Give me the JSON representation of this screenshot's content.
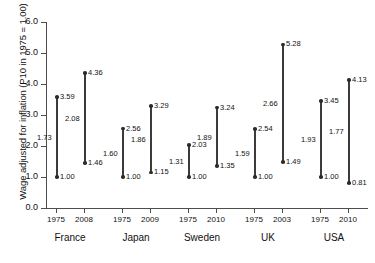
{
  "chart_data": {
    "type": "scatter",
    "title": "",
    "subtitle": "",
    "xlabel": "",
    "ylabel": "Wage adjusted for inflation (P10 in 1975 = 1.00)",
    "ylim": [
      0.0,
      6.0
    ],
    "yticks": [
      "0.0",
      "1.0",
      "2.0",
      "3.0",
      "4.0",
      "5.0",
      "6.0"
    ],
    "grid": false,
    "legend": "none",
    "note": "Each vertical segment spans from the lower wage value to the upper wage value for a given country-year; the number beside the middle of each segment is the ratio of upper to lower.",
    "groups": [
      {
        "country": "France",
        "series": [
          {
            "year": "1975",
            "low": 1.0,
            "high": 3.59,
            "ratio": 1.73,
            "low_label": "1.00",
            "high_label": "3.59",
            "ratio_label": "1.73"
          },
          {
            "year": "2008",
            "low": 1.46,
            "high": 4.36,
            "ratio": 2.08,
            "low_label": "1.46",
            "high_label": "4.36",
            "ratio_label": "2.08"
          }
        ]
      },
      {
        "country": "Japan",
        "series": [
          {
            "year": "1975",
            "low": 1.0,
            "high": 2.56,
            "ratio": 1.6,
            "low_label": "1.00",
            "high_label": "2.56",
            "ratio_label": "1.60"
          },
          {
            "year": "2009",
            "low": 1.15,
            "high": 3.29,
            "ratio": 1.86,
            "low_label": "1.15",
            "high_label": "3.29",
            "ratio_label": "1.86"
          }
        ]
      },
      {
        "country": "Sweden",
        "series": [
          {
            "year": "1975",
            "low": 1.0,
            "high": 2.03,
            "ratio": 1.31,
            "low_label": "1.00",
            "high_label": "2.03",
            "ratio_label": "1.31"
          },
          {
            "year": "2010",
            "low": 1.35,
            "high": 3.24,
            "ratio": 1.89,
            "low_label": "1.35",
            "high_label": "3.24",
            "ratio_label": "1.89"
          }
        ]
      },
      {
        "country": "UK",
        "series": [
          {
            "year": "1975",
            "low": 1.0,
            "high": 2.54,
            "ratio": 1.59,
            "low_label": "1.00",
            "high_label": "2.54",
            "ratio_label": "1.59"
          },
          {
            "year": "2003",
            "low": 1.49,
            "high": 5.28,
            "ratio": 2.66,
            "low_label": "1.49",
            "high_label": "5.28",
            "ratio_label": "2.66"
          }
        ]
      },
      {
        "country": "USA",
        "series": [
          {
            "year": "1975",
            "low": 1.0,
            "high": 3.45,
            "ratio": 1.93,
            "low_label": "1.00",
            "high_label": "3.45",
            "ratio_label": "1.93"
          },
          {
            "year": "2010",
            "low": 0.81,
            "high": 4.13,
            "ratio": 1.77,
            "low_label": "0.81",
            "high_label": "4.13",
            "ratio_label": "1.77"
          }
        ]
      }
    ]
  },
  "colors": {
    "segment": "#3b3b3b",
    "dot": "#2b2b2b",
    "axis": "#4d4d4d",
    "text": "#111111",
    "background": "#ffffff"
  }
}
